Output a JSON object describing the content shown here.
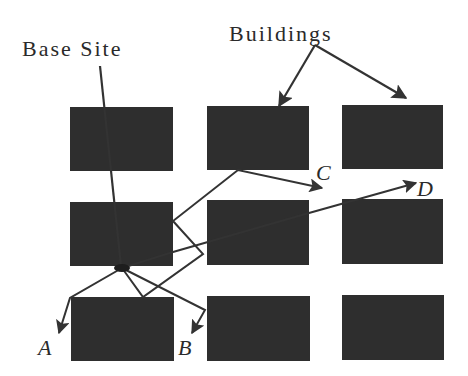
{
  "labels": {
    "base_site": "Base Site",
    "buildings": "Buildings",
    "destinations": [
      "A",
      "B",
      "C",
      "D"
    ]
  },
  "colors": {
    "building_fill": "#2e2e2e",
    "line": "#333333",
    "text": "#2a2a2a",
    "background": "#ffffff"
  },
  "grid": {
    "rows": 3,
    "cols": 3,
    "buildings": [
      {
        "x": 70,
        "y": 107,
        "w": 103,
        "h": 64
      },
      {
        "x": 207,
        "y": 106,
        "w": 102,
        "h": 64
      },
      {
        "x": 342,
        "y": 105,
        "w": 101,
        "h": 64
      },
      {
        "x": 70,
        "y": 202,
        "w": 103,
        "h": 64
      },
      {
        "x": 207,
        "y": 200,
        "w": 102,
        "h": 65
      },
      {
        "x": 342,
        "y": 199,
        "w": 101,
        "h": 65
      },
      {
        "x": 71,
        "y": 297,
        "w": 103,
        "h": 64
      },
      {
        "x": 207,
        "y": 296,
        "w": 103,
        "h": 65
      },
      {
        "x": 342,
        "y": 295,
        "w": 102,
        "h": 65
      }
    ]
  },
  "base_site_position": {
    "x": 122,
    "y": 268
  },
  "paths": [
    {
      "to": "A",
      "points": [
        [
          122,
          268
        ],
        [
          70,
          298
        ],
        [
          59,
          333
        ]
      ]
    },
    {
      "to": "B",
      "points": [
        [
          122,
          268
        ],
        [
          205,
          310
        ],
        [
          192,
          333
        ]
      ]
    },
    {
      "to": "C",
      "points": [
        [
          122,
          268
        ],
        [
          143,
          297
        ],
        [
          203,
          254
        ],
        [
          173,
          221
        ],
        [
          238,
          170
        ],
        [
          322,
          188
        ]
      ]
    },
    {
      "to": "D",
      "points": [
        [
          122,
          268
        ],
        [
          173,
          252
        ],
        [
          309,
          213
        ],
        [
          416,
          183
        ]
      ]
    }
  ]
}
